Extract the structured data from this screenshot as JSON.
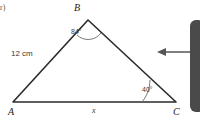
{
  "figure": {
    "item_tag": "r)",
    "shape": "triangle",
    "vertices": [
      {
        "name": "B",
        "label": "B",
        "x": 88,
        "y": 20
      },
      {
        "name": "A",
        "label": "A",
        "x": 13,
        "y": 102
      },
      {
        "name": "C",
        "label": "C",
        "x": 176,
        "y": 102
      }
    ],
    "vertex_labels": [
      {
        "key": "label-B",
        "text": "B",
        "left": 74,
        "top": 3
      },
      {
        "key": "label-A",
        "text": "A",
        "left": 8,
        "top": 107
      },
      {
        "key": "label-C",
        "text": "C",
        "left": 173,
        "top": 107
      }
    ],
    "angles": [
      {
        "at": "B",
        "text": "84°",
        "value": 84,
        "left": 71,
        "top": 28
      },
      {
        "at": "C",
        "text": "40°",
        "value": 40,
        "left": 142,
        "top": 86
      }
    ],
    "sides": [
      {
        "name": "AB",
        "text": "12 cm",
        "value": "12",
        "unit": "cm",
        "left": 11,
        "top": 50,
        "italic": false
      },
      {
        "name": "AC",
        "text": "x",
        "value": "x",
        "unit": "",
        "left": 92,
        "top": 107,
        "italic": true
      }
    ],
    "colors": {
      "stroke": "#2b2b2b",
      "arc": "#6a6a6a",
      "background": "#ffffff",
      "callout": "#4a4a4a",
      "arrow": "#555555"
    }
  },
  "annotation": {
    "arrow_name": "left-pointing-arrow",
    "arrow_y": 52,
    "arrow_from_x": 196,
    "arrow_to_x": 158
  }
}
